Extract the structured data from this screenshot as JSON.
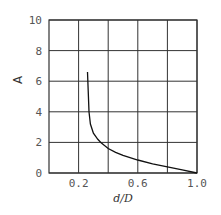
{
  "chart_data": {
    "type": "line",
    "title": "",
    "xlabel": "d/D",
    "ylabel": "A",
    "xlim": [
      0,
      1.0
    ],
    "ylim": [
      0,
      10
    ],
    "grid": true,
    "x_ticks": [
      0.2,
      0.4,
      0.6,
      0.8,
      1.0
    ],
    "x_tick_labels": [
      "0.2",
      "",
      "0.6",
      "",
      "1.0"
    ],
    "y_ticks": [
      0,
      2,
      4,
      6,
      8,
      10
    ],
    "y_tick_labels": [
      "0",
      "2",
      "4",
      "6",
      "8",
      "10"
    ],
    "series": [
      {
        "name": "A",
        "x": [
          0.26,
          0.265,
          0.27,
          0.28,
          0.3,
          0.33,
          0.35,
          0.4,
          0.45,
          0.5,
          0.6,
          0.7,
          0.8,
          0.9,
          1.0
        ],
        "y": [
          6.6,
          5.4,
          4.0,
          3.2,
          2.6,
          2.2,
          2.0,
          1.6,
          1.35,
          1.15,
          0.85,
          0.6,
          0.4,
          0.2,
          0.0
        ]
      }
    ],
    "legend": null
  },
  "labels": {
    "xlabel": "d/D",
    "ylabel": "A"
  },
  "colors": {
    "grid": "#333333",
    "curve": "#111111",
    "text": "#555555"
  }
}
